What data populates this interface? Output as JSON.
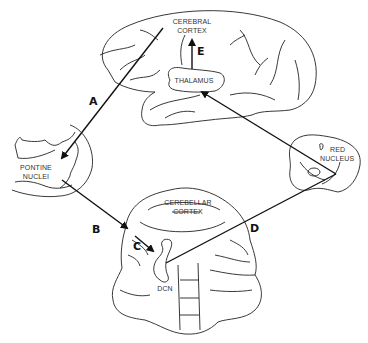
{
  "diagram": {
    "structures": {
      "cerebral_cortex": [
        "CEREBRAL",
        "CORTEX"
      ],
      "thalamus": "THALAMUS",
      "pontine_nuclei": [
        "PONTINE",
        "NUCLEI"
      ],
      "red_nucleus": [
        "RED",
        "NUCLEUS"
      ],
      "cerebellar_cortex": [
        "CEREBELLAR",
        "CORTEX"
      ],
      "dcn": "DCN"
    },
    "pathways": {
      "A": "A",
      "B": "B",
      "C": "C",
      "D": "D",
      "E": "E"
    },
    "colors": {
      "line": "#111111",
      "background": "#ffffff"
    }
  }
}
